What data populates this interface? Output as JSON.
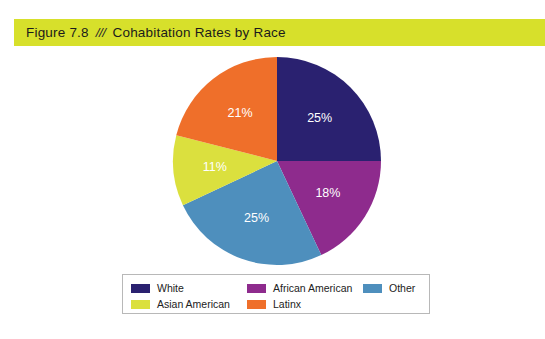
{
  "figure": {
    "number": "Figure 7.8",
    "separator": "///",
    "title": "Cohabitation Rates by Race",
    "band_color": "#d7e02b"
  },
  "chart_data": {
    "type": "pie",
    "title": "Cohabitation Rates by Race",
    "xlabel": "",
    "ylabel": "",
    "unit": "%",
    "start_angle_deg": 0,
    "direction": "clockwise",
    "legend_position": "bottom",
    "grid": false,
    "categories": [
      "White",
      "African American",
      "Other",
      "Asian American",
      "Latinx"
    ],
    "values": [
      25,
      18,
      25,
      11,
      21
    ],
    "data_labels": [
      "25%",
      "18%",
      "25%",
      "11%",
      "21%"
    ],
    "colors": [
      "#2a2170",
      "#8e2b8d",
      "#4e8fbd",
      "#dbe03e",
      "#ef6f2a"
    ],
    "label_text_colors": [
      "#ffffff",
      "#ffffff",
      "#ffffff",
      "#3a3a33",
      "#ffffff"
    ],
    "slices": [
      {
        "name": "White",
        "value": 25,
        "label": "25%",
        "color": "#2a2170",
        "label_color": "#ffffff"
      },
      {
        "name": "African American",
        "value": 18,
        "label": "18%",
        "color": "#8e2b8d",
        "label_color": "#ffffff"
      },
      {
        "name": "Other",
        "value": 25,
        "label": "25%",
        "color": "#4e8fbd",
        "label_color": "#ffffff"
      },
      {
        "name": "Asian American",
        "value": 11,
        "label": "11%",
        "color": "#dbe03e",
        "label_color": "#3a3a33"
      },
      {
        "name": "Latinx",
        "value": 21,
        "label": "21%",
        "color": "#ef6f2a",
        "label_color": "#ffffff"
      }
    ]
  },
  "legend": {
    "items": [
      {
        "label": "White",
        "color": "#2a2170"
      },
      {
        "label": "African American",
        "color": "#8e2b8d"
      },
      {
        "label": "Other",
        "color": "#4e8fbd"
      },
      {
        "label": "Asian American",
        "color": "#dbe03e"
      },
      {
        "label": "Latinx",
        "color": "#ef6f2a"
      }
    ],
    "order": [
      0,
      1,
      2,
      3,
      4
    ]
  }
}
